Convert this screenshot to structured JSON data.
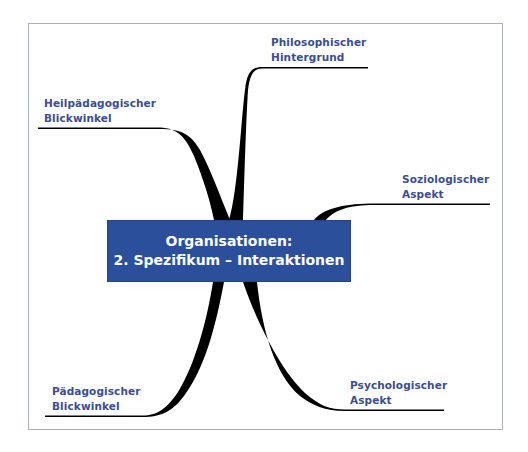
{
  "diagram": {
    "type": "mind-map",
    "colors": {
      "center_box": "#2b4f9b",
      "center_text": "#ffffff",
      "label_text": "#3b4e8e",
      "branch": "#000000",
      "frame_border": "#a9b0c4"
    },
    "center": {
      "line1": "Organisationen:",
      "line2": "2. Spezifikum – Interaktionen"
    },
    "branches": [
      {
        "id": "philosophisch",
        "line1": "Philosophischer",
        "line2": "Hintergrund",
        "position": "top-right"
      },
      {
        "id": "heilpaedagogisch",
        "line1": "Heilpädagogischer",
        "line2": "Blickwinkel",
        "position": "top-left"
      },
      {
        "id": "soziologisch",
        "line1": "Soziologischer",
        "line2": "Aspekt",
        "position": "right"
      },
      {
        "id": "psychologisch",
        "line1": "Psychologischer",
        "line2": "Aspekt",
        "position": "bottom-right"
      },
      {
        "id": "paedagogisch",
        "line1": "Pädagogischer",
        "line2": "Blickwinkel",
        "position": "bottom-left"
      }
    ]
  }
}
